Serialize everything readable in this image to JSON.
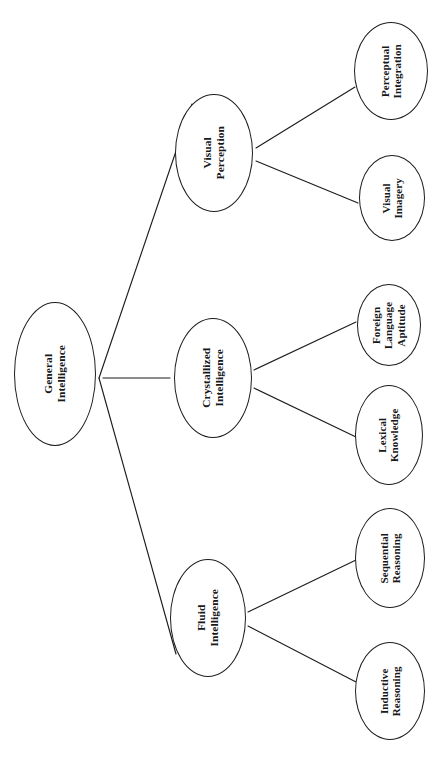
{
  "diagram": {
    "type": "hierarchical-tree",
    "orientation": "rotated-90-left",
    "background_color": "#ffffff",
    "stroke_color": "#1d1d1d",
    "text_color": "#16181a",
    "node_shape": "ellipse",
    "levels": 3
  },
  "nodes": {
    "root": {
      "id": "general-intelligence",
      "label": "General\nIntelligence",
      "level": 0,
      "cx": 55,
      "cy": 374,
      "rx": 41,
      "ry": 72
    },
    "mid": [
      {
        "id": "visual-perception",
        "label": "Visual\nPerception",
        "level": 1,
        "cx": 214,
        "cy": 153,
        "rx": 39,
        "ry": 59
      },
      {
        "id": "crystallized-intelligence",
        "label": "Crystallized\nIntelligence",
        "level": 1,
        "cx": 213,
        "cy": 378,
        "rx": 39,
        "ry": 60
      },
      {
        "id": "fluid-intelligence",
        "label": "Fluid\nIntelligence",
        "level": 1,
        "cx": 208,
        "cy": 618,
        "rx": 38,
        "ry": 59
      }
    ],
    "leaves": [
      {
        "id": "perceptual-integration",
        "label": "Perceptual\nIntegration",
        "level": 2,
        "parent": "visual-perception",
        "cx": 391,
        "cy": 71,
        "rx": 37,
        "ry": 49
      },
      {
        "id": "visual-imagery",
        "label": "Visual\nImagery",
        "level": 2,
        "parent": "visual-perception",
        "cx": 392,
        "cy": 198,
        "rx": 33,
        "ry": 43
      },
      {
        "id": "foreign-language-aptitude",
        "label": "Foreign\nLanguage\nAptitude",
        "level": 2,
        "parent": "crystallized-intelligence",
        "cx": 389,
        "cy": 325,
        "rx": 32,
        "ry": 41
      },
      {
        "id": "lexical-knowledge",
        "label": "Lexical\nKnowledge",
        "level": 2,
        "parent": "crystallized-intelligence",
        "cx": 389,
        "cy": 435,
        "rx": 34,
        "ry": 50
      },
      {
        "id": "sequential-reasoning",
        "label": "Sequential\nReasoning",
        "level": 2,
        "parent": "fluid-intelligence",
        "cx": 390,
        "cy": 558,
        "rx": 35,
        "ry": 50
      },
      {
        "id": "inductive-reasoning",
        "label": "Inductive\nReasoning",
        "level": 2,
        "parent": "fluid-intelligence",
        "cx": 390,
        "cy": 691,
        "rx": 35,
        "ry": 49
      }
    ]
  },
  "edges": [
    {
      "id": "edge-root-visual-perception",
      "from": "general-intelligence",
      "to": "visual-perception",
      "x1": 99,
      "y1": 378,
      "x2": 192,
      "y2": 104
    },
    {
      "id": "edge-root-crystallized",
      "from": "general-intelligence",
      "to": "crystallized-intelligence",
      "x1": 103,
      "y1": 378,
      "x2": 170,
      "y2": 378
    },
    {
      "id": "edge-root-fluid",
      "from": "general-intelligence",
      "to": "fluid-intelligence",
      "x1": 99,
      "y1": 378,
      "x2": 176,
      "y2": 654
    },
    {
      "id": "edge-vp-perceptual-integration",
      "from": "visual-perception",
      "to": "perceptual-integration",
      "x1": 256,
      "y1": 148,
      "x2": 355,
      "y2": 87
    },
    {
      "id": "edge-vp-visual-imagery",
      "from": "visual-perception",
      "to": "visual-imagery",
      "x1": 256,
      "y1": 161,
      "x2": 358,
      "y2": 203
    },
    {
      "id": "edge-ci-foreign-language",
      "from": "crystallized-intelligence",
      "to": "foreign-language-aptitude",
      "x1": 254,
      "y1": 370,
      "x2": 356,
      "y2": 322
    },
    {
      "id": "edge-ci-lexical-knowledge",
      "from": "crystallized-intelligence",
      "to": "lexical-knowledge",
      "x1": 254,
      "y1": 388,
      "x2": 356,
      "y2": 437
    },
    {
      "id": "edge-fi-sequential-reasoning",
      "from": "fluid-intelligence",
      "to": "sequential-reasoning",
      "x1": 248,
      "y1": 612,
      "x2": 356,
      "y2": 560
    },
    {
      "id": "edge-fi-inductive-reasoning",
      "from": "fluid-intelligence",
      "to": "inductive-reasoning",
      "x1": 248,
      "y1": 626,
      "x2": 356,
      "y2": 682
    }
  ]
}
